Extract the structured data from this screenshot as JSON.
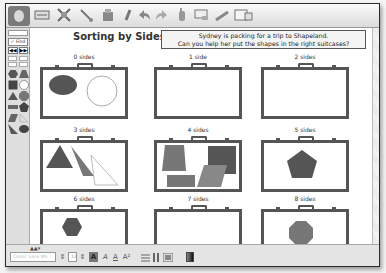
{
  "toolbar": {
    "icons": [
      "app-logo-icon",
      "select-tool-icon",
      "shapes-tool-icon",
      "line-tool-icon",
      "paint-tool-icon",
      "pen-tool-icon",
      "undo-icon",
      "redo-icon",
      "hand-tool-icon",
      "screen-icon",
      "pencil-icon",
      "page-tool-icon"
    ]
  },
  "left_panel": {
    "find_label": "Find",
    "nav_buttons": [
      "◀◀",
      "▶▶",
      "▼"
    ],
    "shapes": [
      "hexagon",
      "trapezoid",
      "square",
      "circle",
      "triangle",
      "octagon",
      "rectangle",
      "pentagon",
      "parallelogram",
      "right-triangle",
      "triangle-2",
      "ellipse"
    ]
  },
  "page": {
    "title": "Sorting by Sides",
    "instructions_line1": "Sydney is packing for a trip to Shapeland.",
    "instructions_line2": "Can you help her put the shapes in the right suitcases?",
    "suitcases": [
      {
        "label": "0 sides",
        "contents": [
          "ellipse",
          "circle"
        ]
      },
      {
        "label": "1 side",
        "contents": []
      },
      {
        "label": "2 sides",
        "contents": []
      },
      {
        "label": "3 sides",
        "contents": [
          "triangle",
          "right-triangle",
          "outline-triangle"
        ]
      },
      {
        "label": "4 sides",
        "contents": [
          "trapezoid",
          "square",
          "rectangle",
          "parallelogram"
        ]
      },
      {
        "label": "5 sides",
        "contents": [
          "pentagon"
        ]
      },
      {
        "label": "6 sides",
        "contents": [
          "hexagon"
        ]
      },
      {
        "label": "7 sides",
        "contents": []
      },
      {
        "label": "8 sides",
        "contents": [
          "octagon"
        ]
      }
    ]
  },
  "statusbar": {
    "font_field": "Comic Sans MS",
    "size_field": "12",
    "format_buttons": [
      "A",
      "A",
      "A",
      "A²"
    ],
    "colors": {
      "fill_dark": "#555555",
      "fill_mid": "#777777",
      "outline": "#555555"
    }
  }
}
